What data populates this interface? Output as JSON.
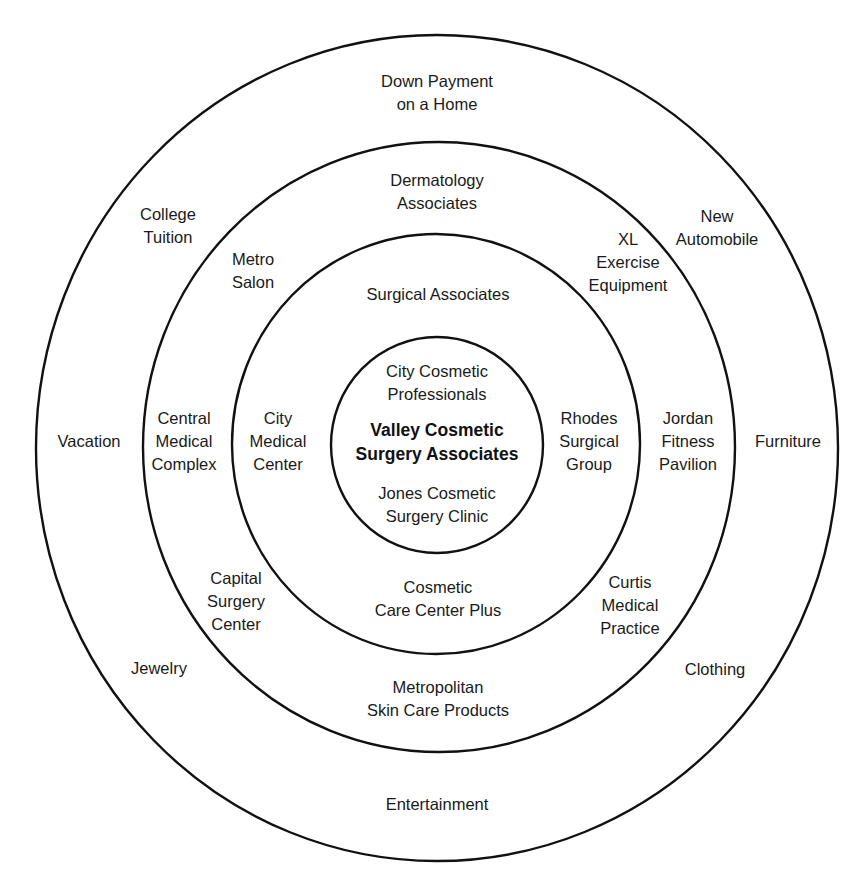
{
  "diagram": {
    "stroke_color": "#111111",
    "background": "#ffffff",
    "rings": [
      {
        "name": "outer",
        "cx": 437,
        "cy": 448,
        "rx": 401,
        "ry": 413
      },
      {
        "name": "third",
        "cx": 439,
        "cy": 447,
        "rx": 296,
        "ry": 305
      },
      {
        "name": "second",
        "cx": 436,
        "cy": 444,
        "rx": 204,
        "ry": 210
      },
      {
        "name": "inner",
        "cx": 437,
        "cy": 445,
        "rx": 106,
        "ry": 108
      }
    ],
    "center": {
      "lines": [
        "Valley Cosmetic",
        "Surgery Associates"
      ],
      "x": 437,
      "y": 442
    },
    "inner_ring": [
      {
        "lines": [
          "City Cosmetic",
          "Professionals"
        ],
        "x": 437,
        "y": 383
      },
      {
        "lines": [
          "Jones Cosmetic",
          "Surgery Clinic"
        ],
        "x": 437,
        "y": 505
      }
    ],
    "second_ring": [
      {
        "lines": [
          "Surgical Associates"
        ],
        "x": 438,
        "y": 294
      },
      {
        "lines": [
          "City",
          "Medical",
          "Center"
        ],
        "x": 278,
        "y": 441
      },
      {
        "lines": [
          "Rhodes",
          "Surgical",
          "Group"
        ],
        "x": 589,
        "y": 441
      },
      {
        "lines": [
          "Cosmetic",
          "Care Center Plus"
        ],
        "x": 438,
        "y": 599
      }
    ],
    "third_ring": [
      {
        "lines": [
          "Dermatology",
          "Associates"
        ],
        "x": 437,
        "y": 192
      },
      {
        "lines": [
          "Metro",
          "Salon"
        ],
        "x": 253,
        "y": 271
      },
      {
        "lines": [
          "XL",
          "Exercise",
          "Equipment"
        ],
        "x": 628,
        "y": 262
      },
      {
        "lines": [
          "Central",
          "Medical",
          "Complex"
        ],
        "x": 184,
        "y": 441
      },
      {
        "lines": [
          "Jordan",
          "Fitness",
          "Pavilion"
        ],
        "x": 688,
        "y": 441
      },
      {
        "lines": [
          "Capital",
          "Surgery",
          "Center"
        ],
        "x": 236,
        "y": 601
      },
      {
        "lines": [
          "Curtis",
          "Medical",
          "Practice"
        ],
        "x": 630,
        "y": 605
      },
      {
        "lines": [
          "Metropolitan",
          "Skin Care Products"
        ],
        "x": 438,
        "y": 699
      }
    ],
    "outer_ring": [
      {
        "lines": [
          "Down Payment",
          "on a Home"
        ],
        "x": 437,
        "y": 93
      },
      {
        "lines": [
          "College",
          "Tuition"
        ],
        "x": 168,
        "y": 226
      },
      {
        "lines": [
          "New",
          "Automobile"
        ],
        "x": 717,
        "y": 228
      },
      {
        "lines": [
          "Vacation"
        ],
        "x": 89,
        "y": 441
      },
      {
        "lines": [
          "Furniture"
        ],
        "x": 788,
        "y": 441
      },
      {
        "lines": [
          "Jewelry"
        ],
        "x": 159,
        "y": 668
      },
      {
        "lines": [
          "Clothing"
        ],
        "x": 715,
        "y": 669
      },
      {
        "lines": [
          "Entertainment"
        ],
        "x": 437,
        "y": 804
      }
    ]
  }
}
